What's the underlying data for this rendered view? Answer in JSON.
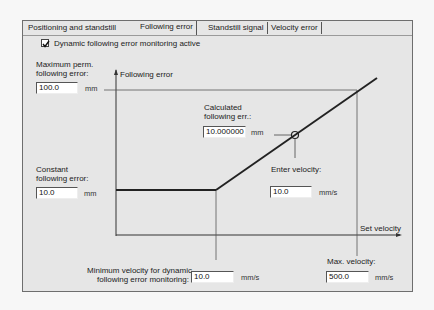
{
  "tabs": [
    {
      "label": "Positioning and standstill",
      "active": false
    },
    {
      "label": "Following error",
      "active": true
    },
    {
      "label": "Standstill signal",
      "active": false
    },
    {
      "label": "Velocity error",
      "active": false
    }
  ],
  "dynamic_monitoring": {
    "label": "Dynamic following error monitoring active",
    "checked": true
  },
  "max_perm_error": {
    "label_line1": "Maximum perm.",
    "label_line2": "following error:",
    "value": "100.0",
    "unit": "mm"
  },
  "constant_error": {
    "label_line1": "Constant",
    "label_line2": "following error:",
    "value": "10.0",
    "unit": "mm"
  },
  "calculated_error": {
    "label_line1": "Calculated",
    "label_line2": "following err.:",
    "value": "10.000000",
    "unit": "mm"
  },
  "enter_velocity": {
    "label": "Enter velocity:",
    "value": "10.0",
    "unit": "mm/s"
  },
  "min_velocity": {
    "label_line1": "Minimum velocity for dynamic",
    "label_line2": "following error monitoring:",
    "value": "10.0",
    "unit": "mm/s"
  },
  "max_velocity": {
    "label": "Max. velocity:",
    "value": "500.0",
    "unit": "mm/s"
  },
  "graph": {
    "y_axis_label": "Following error",
    "x_axis_label": "Set velocity",
    "line_color": "#222222"
  }
}
